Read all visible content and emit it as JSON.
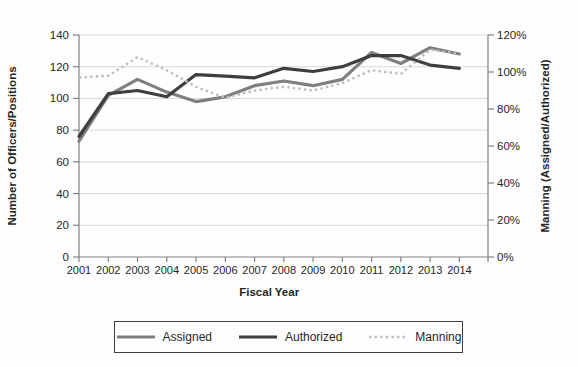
{
  "chart_data": {
    "type": "line",
    "title": "",
    "xlabel": "Fiscal Year",
    "categories": [
      "2001",
      "2002",
      "2003",
      "2004",
      "2005",
      "2006",
      "2007",
      "2008",
      "2009",
      "2010",
      "2011",
      "2012",
      "2013",
      "2014"
    ],
    "left_axis": {
      "label": "Number of Officers/Positions",
      "min": 0,
      "max": 140,
      "step": 20,
      "ticks": [
        "0",
        "20",
        "40",
        "60",
        "80",
        "100",
        "120",
        "140"
      ]
    },
    "right_axis": {
      "label": "Manning (Assigned/Authorized)",
      "min": 0,
      "max": 120,
      "step": 20,
      "suffix": "%",
      "ticks": [
        "0%",
        "20%",
        "40%",
        "60%",
        "80%",
        "100%",
        "120%"
      ]
    },
    "grid": true,
    "legend_position": "bottom",
    "colors": {
      "gridline": "#d9d9d9",
      "axis": "#808080",
      "text": "#262626"
    },
    "series": [
      {
        "name": "Assigned",
        "axis": "left",
        "style": "solid",
        "color": "#7f7f7f",
        "values": [
          73,
          102,
          112,
          104,
          98,
          101,
          108,
          111,
          108,
          112,
          129,
          122,
          132,
          128
        ]
      },
      {
        "name": "Authorized",
        "axis": "left",
        "style": "solid",
        "color": "#3f3f3f",
        "values": [
          76,
          103,
          105,
          101,
          115,
          114,
          113,
          119,
          117,
          120,
          127,
          127,
          121,
          119
        ]
      },
      {
        "name": "Manning",
        "axis": "right",
        "style": "dotted",
        "color": "#bdbdbd",
        "values": [
          97,
          98,
          108,
          101,
          92,
          86,
          90,
          92,
          90,
          94,
          101,
          99,
          112,
          110
        ]
      }
    ]
  }
}
